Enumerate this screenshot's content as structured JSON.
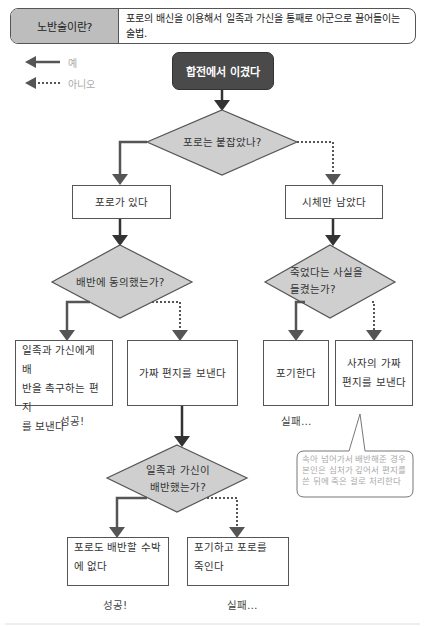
{
  "header": {
    "label": "노반술이란?",
    "description": "포로의 배신을 이용해서 일족과 가신을 통째로 아군으로 끌어들이는 술법."
  },
  "legend": {
    "yes_label": "예",
    "no_label": "아니오"
  },
  "colors": {
    "start_fill": "#4a4a4a",
    "decision_fill": "#cfcfcf",
    "header_label_fill": "#bdbdbd",
    "line": "#555555"
  },
  "flow": {
    "start": "합전에서 이겼다",
    "decision1": "포로는 붙잡았나?",
    "d1_yes": "포로가 있다",
    "d1_no": "시체만 남았다",
    "decision2": "배반에 동의했는가?",
    "d2_yes": "일족과 가신에게 배반을 촉구하는 편지를 보낸다",
    "d2_yes_lines": [
      "일족과 가신에게 배",
      "반을 촉구하는 편지",
      "를 보낸다"
    ],
    "d2_no": "가짜 편지를 보낸다",
    "decision3_lines": [
      "죽었다는 사실을",
      "들켰는가?"
    ],
    "d3_yes": "포기한다",
    "d3_no_lines": [
      "사자의 가짜",
      "편지를 보낸다"
    ],
    "decision4_lines": [
      "일족과 가신이",
      "배반했는가?"
    ],
    "d4_yes_lines": [
      "포로도 배반할 수박",
      "에 없다"
    ],
    "d4_no_lines": [
      "포기하고 포로를",
      "죽인다"
    ],
    "result_success": "성공!",
    "result_fail": "실패…",
    "callout": "속아 넘어가서 배반해준 경우 본인은 심처가 깊어서 편지를 쓴 뒤에 죽은 걸로 처리한다"
  }
}
